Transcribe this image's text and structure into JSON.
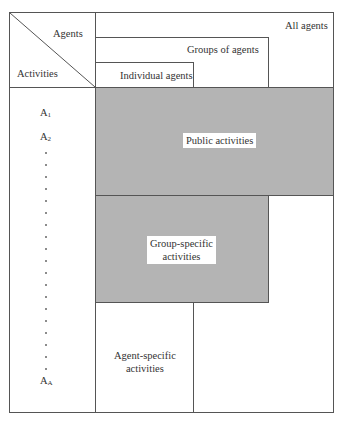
{
  "diagram": {
    "corner": {
      "agents_label": "Agents",
      "activities_label": "Activities"
    },
    "agent_levels": [
      {
        "label": "All agents"
      },
      {
        "label": "Groups of agents"
      },
      {
        "label": "Individual agents"
      }
    ],
    "activity_rows": {
      "first": "A",
      "first_sub": "1",
      "second": "A",
      "second_sub": "2",
      "last": "A",
      "last_sub": "A"
    },
    "regions": [
      {
        "label": "Public activities",
        "shaded": true,
        "color": "#b4b4b4"
      },
      {
        "label_line1": "Group-specific",
        "label_line2": "activities",
        "shaded": true,
        "color": "#b4b4b4"
      },
      {
        "label_line1": "Agent-specific",
        "label_line2": "activities",
        "shaded": false
      }
    ]
  }
}
